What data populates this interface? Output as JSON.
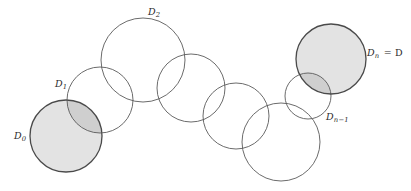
{
  "figure": {
    "kind": "geometric-diagram",
    "background_color": "#ffffff",
    "stroke_color": "#5a5a5a",
    "shaded_fill": "#e3e3e3",
    "overlap_fill": "#cfcfcf",
    "shaded_stroke": "#4a4a4a",
    "stroke_width": 0.9,
    "shaded_stroke_width": 1.3
  },
  "labels": [
    {
      "id": "label-d0",
      "base": "D",
      "sub": "0",
      "suffix": "",
      "x": 14,
      "y": 131
    },
    {
      "id": "label-d1",
      "base": "D",
      "sub": "1",
      "suffix": "",
      "x": 55,
      "y": 79
    },
    {
      "id": "label-d2",
      "base": "D",
      "sub": "2",
      "suffix": "",
      "x": 148,
      "y": 7
    },
    {
      "id": "label-dn1",
      "base": "D",
      "sub": "n−1",
      "suffix": "",
      "x": 326,
      "y": 112
    },
    {
      "id": "label-dn",
      "base": "D",
      "sub": "n",
      "suffix": "= D",
      "x": 367,
      "y": 48
    }
  ],
  "circles": [
    {
      "id": "circle-d0",
      "name": "D0",
      "cx": 66,
      "cy": 136,
      "r": 36,
      "shaded": true
    },
    {
      "id": "circle-d1",
      "name": "D1",
      "cx": 100,
      "cy": 100,
      "r": 33,
      "shaded": false
    },
    {
      "id": "circle-d2",
      "name": "D2",
      "cx": 143,
      "cy": 60,
      "r": 42,
      "shaded": false
    },
    {
      "id": "circle-d3",
      "name": "D3",
      "cx": 191,
      "cy": 88,
      "r": 34,
      "shaded": false
    },
    {
      "id": "circle-d4",
      "name": "D4",
      "cx": 236,
      "cy": 116,
      "r": 33,
      "shaded": false
    },
    {
      "id": "circle-d5",
      "name": "D5",
      "cx": 281,
      "cy": 142,
      "r": 39,
      "shaded": false
    },
    {
      "id": "circle-dn-minus",
      "name": "Dn-1",
      "cx": 308,
      "cy": 96,
      "r": 23,
      "shaded": false
    },
    {
      "id": "circle-dn",
      "name": "Dn",
      "cx": 331,
      "cy": 59,
      "r": 35,
      "shaded": true
    }
  ],
  "overlaps": [
    {
      "id": "overlap-d0-d1",
      "a": "circle-d0",
      "b": "circle-d1"
    },
    {
      "id": "overlap-dn1-dn",
      "a": "circle-dn-minus",
      "b": "circle-dn"
    }
  ]
}
